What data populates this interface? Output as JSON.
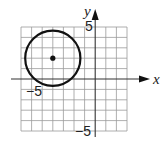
{
  "diagram": {
    "type": "coordinate-plane",
    "axes": {
      "x_label": "x",
      "y_label": "y",
      "x_range": [
        -7,
        3
      ],
      "y_range": [
        -5,
        5
      ],
      "tick_labels": {
        "x_neg": "−5",
        "y_pos": "5",
        "y_neg": "−5"
      }
    },
    "grid": {
      "on": true,
      "step": 1,
      "color": "#8a8a8a"
    },
    "shapes": [
      {
        "kind": "circle",
        "center": [
          -4,
          2
        ],
        "radius": 2.6,
        "stroke": "#111111"
      },
      {
        "kind": "point",
        "at": [
          -4,
          2
        ],
        "label": "center"
      }
    ]
  }
}
